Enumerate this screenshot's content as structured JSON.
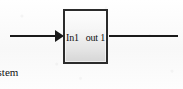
{
  "diagram": {
    "background_color": "#fbfbfb",
    "line_color": "#1a1a1a",
    "block": {
      "name": "subsystem-block",
      "caption": "Subsystem",
      "border_color": "#2b2b2b",
      "fill_top_color": "#fdfdfd",
      "fill_bottom_color": "#d6d6d6",
      "ports": {
        "input_label": "In1",
        "output_label": "out 1"
      }
    },
    "wires": {
      "input": {
        "name": "input-wire",
        "has_arrowhead": true,
        "arrow_direction": "right"
      },
      "output": {
        "name": "output-wire",
        "has_arrowhead": false,
        "arrow_direction": "right"
      }
    }
  }
}
